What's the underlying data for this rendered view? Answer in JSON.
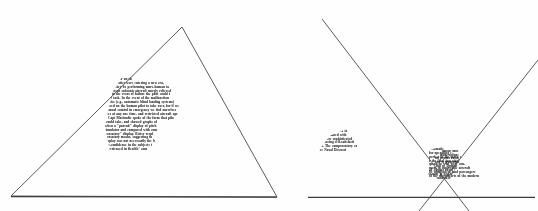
{
  "page": {
    "background_color": "#fefefe",
    "ink_color": "#20201e",
    "line_color": "#4a4a4a",
    "width": 538,
    "height": 211
  },
  "figures": [
    {
      "id": "figure-left",
      "name": "left-triangle-figure",
      "shape": "triangle",
      "description": "Outline triangle with apex at top, drawn over a patch of photocopied journal text",
      "vertices": [
        [
          182,
          27
        ],
        [
          11,
          196
        ],
        [
          277,
          197
        ]
      ],
      "baseline_y": 196
    },
    {
      "id": "figure-right",
      "name": "right-crossed-lines-figure",
      "shape": "crossed-lines",
      "description": "Two straight lines crossing in an X near the baseline, over a blob of photocopied journal text, part of it inverted",
      "line_a": [
        [
          53,
          19
        ],
        [
          200,
          211
        ]
      ],
      "line_b": [
        [
          269,
          60
        ],
        [
          150,
          211
        ]
      ],
      "baseline_y": 197,
      "baseline_span": [
        39,
        266
      ]
    }
  ],
  "text_patches": {
    "left_body": {
      "name": "left-text-patch",
      "lines": [
        "ancilla",
        "duced an",
        "ating factor on th",
        "Automatics were entering a new era,",
        "would they be performing more-human ta",
        "in current subsonic aircraft merely relieved",
        "and in the event of failure the pilot could t",
        "their task. In the event of the malfunction",
        "matics (e.g., automatic blind landing systems)",
        "placed on the human pilot to take over, for if we",
        "manual control in emergency we tied ourselves",
        "ities at any one time, and restricted aircraft ope",
        "Capt Matiendie spoke of the form that pilo",
        "would take, and showed graphs of",
        "when a \"pursuit\" display of pitch",
        "simulator and compared with com",
        "pensatory\" display. Better resul",
        "pensatory means, suggesting th",
        "display was not necessarily the b",
        "ver-confidence in the subjects t",
        "experienced in flexible' com"
      ]
    },
    "left_sliver": {
      "name": "left-text-sliver",
      "lines": [
        "ols",
        "n th",
        "sidered",
        "brought",
        "the highly",
        "equipment",
        "and time.",
        "form in",
        "systems",
        "charac-",
        "ce"
      ]
    },
    "right_body": {
      "name": "right-text-patch-upright",
      "lines": [
        "of monit",
        "'Gee' performanc",
        "information was",
        "lts obtained with a la",
        "s were obtained with",
        "n the more sophisticated",
        "on, inducing self-satisfacti",
        "rated. The compensatory co",
        "See Naval Discussi"
      ]
    },
    "right_inverted": {
      "name": "right-text-patch-inverted",
      "lines": [
        "in aeronautic",
        "comprised of interes",
        "per large concise pr",
        "anomaly as pas",
        "vitational is out",
        "being rained ou",
        "rangen tangi",
        "pane atoms"
      ]
    },
    "right_body2": {
      "name": "right-text-patch-lower",
      "lines": [
        "pi",
        "a te p",
        "automatic",
        "for operating c",
        "perfect in the servo s",
        "r the final two stage",
        "speakers who were con-",
        "ment in supersonic aircraft",
        "be windowless, and passengers",
        "of the discomforts of the modern"
      ]
    }
  }
}
